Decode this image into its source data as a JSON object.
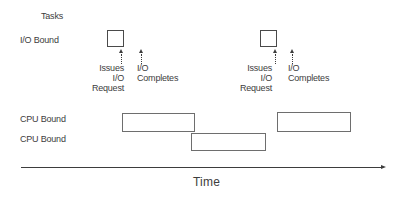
{
  "colors": {
    "ink": "#3d3d3d",
    "box_border": "#4a4a4a",
    "bar_border": "#6e6e6e",
    "bg": "#ffffff"
  },
  "header": {
    "title": "Tasks"
  },
  "rows": {
    "io_bound": {
      "label": "I/O Bound"
    },
    "cpu_bound_1": {
      "label": "CPU Bound"
    },
    "cpu_bound_2": {
      "label": "CPU Bound"
    }
  },
  "io_events": [
    {
      "issues_label": "Issues\nI/O\nRequest",
      "completes_label": "I/O\nCompletes"
    },
    {
      "issues_label": "Issues\nI/O\nRequest",
      "completes_label": "I/O\nCompletes"
    }
  ],
  "axis": {
    "label": "Time"
  }
}
